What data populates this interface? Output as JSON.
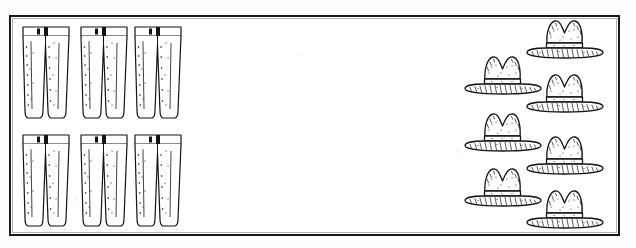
{
  "image": {
    "title": "Counting worksheet: pants and hats",
    "style": "black ink line drawing, scanned clip-art",
    "background_color": "#ffffff",
    "ink_color": "#1a1a1a",
    "border": {
      "present": true,
      "shape": "rectangle",
      "stroke_color": "#1a1a1a",
      "stroke_width_px": 2
    }
  },
  "groups": [
    {
      "id": "pants-group",
      "name": "pants",
      "item_label": "pair-of-pants",
      "count": 6,
      "arrangement": "3 columns x 2 rows grid",
      "position": "left side of frame",
      "items": [
        {
          "index": 1,
          "label": "pair-of-pants-1",
          "row": 1,
          "col": 1,
          "x": 6,
          "y": 4
        },
        {
          "index": 2,
          "label": "pair-of-pants-2",
          "row": 1,
          "col": 2,
          "x": 64,
          "y": 4
        },
        {
          "index": 3,
          "label": "pair-of-pants-3",
          "row": 1,
          "col": 3,
          "x": 118,
          "y": 4
        },
        {
          "index": 4,
          "label": "pair-of-pants-4",
          "row": 2,
          "col": 1,
          "x": 6,
          "y": 112
        },
        {
          "index": 5,
          "label": "pair-of-pants-5",
          "row": 2,
          "col": 2,
          "x": 64,
          "y": 112
        },
        {
          "index": 6,
          "label": "pair-of-pants-6",
          "row": 2,
          "col": 3,
          "x": 118,
          "y": 112
        }
      ],
      "item_parts": [
        "waistband",
        "belt-loop",
        "fly",
        "left-leg",
        "right-leg",
        "stipple-shading"
      ]
    },
    {
      "id": "hats-group",
      "name": "hats",
      "item_label": "cowboy-hat",
      "count": 7,
      "arrangement": "staggered two-column zigzag",
      "position": "right side of frame",
      "items": [
        {
          "index": 1,
          "label": "cowboy-hat-1",
          "column": "right",
          "x": 66,
          "y": 0
        },
        {
          "index": 2,
          "label": "cowboy-hat-2",
          "column": "left",
          "x": 4,
          "y": 36
        },
        {
          "index": 3,
          "label": "cowboy-hat-3",
          "column": "right",
          "x": 66,
          "y": 54
        },
        {
          "index": 4,
          "label": "cowboy-hat-4",
          "column": "left",
          "x": 4,
          "y": 93
        },
        {
          "index": 5,
          "label": "cowboy-hat-5",
          "column": "right",
          "x": 66,
          "y": 116
        },
        {
          "index": 6,
          "label": "cowboy-hat-6",
          "column": "left",
          "x": 4,
          "y": 148
        },
        {
          "index": 7,
          "label": "cowboy-hat-7",
          "column": "right",
          "x": 66,
          "y": 170
        }
      ],
      "item_parts": [
        "pinched-crown",
        "two-peaks",
        "hat-band",
        "wide-brim",
        "stipple-shading",
        "hatch-shading"
      ]
    }
  ],
  "counts": {
    "pants_total": 6,
    "hats_total": 7,
    "difference": 1,
    "more_of": "hats"
  },
  "text_labels": []
}
